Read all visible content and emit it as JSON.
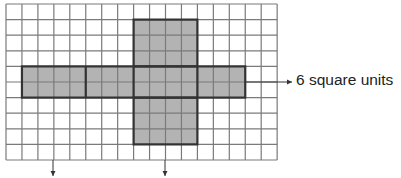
{
  "diagram": {
    "type": "net-on-grid",
    "grid": {
      "columns": 17,
      "rows": 10,
      "left": 6,
      "top": 4,
      "cell_w": 15.95,
      "cell_h": 15.6,
      "line_color": "#7a7a7a"
    },
    "fill_color": "#b3b3b3",
    "outline_color": "#333333",
    "shapes": [
      {
        "name": "vertical-bar",
        "col": 8,
        "row": 1,
        "cols": 4,
        "rows": 8
      },
      {
        "name": "horizontal-bar",
        "col": 1,
        "row": 4,
        "cols": 14,
        "rows": 2
      }
    ],
    "dividers": [
      {
        "orientation": "vertical",
        "col": 5,
        "row": 4,
        "rows": 2
      },
      {
        "orientation": "horizontal",
        "row": 4,
        "col": 8,
        "cols": 4
      },
      {
        "orientation": "horizontal",
        "row": 6,
        "col": 8,
        "cols": 4
      }
    ]
  },
  "annotations": {
    "right_label": "6 square units",
    "arrows": [
      {
        "name": "right-arrow",
        "from": [
          246,
          82
        ],
        "to": [
          292,
          82
        ]
      },
      {
        "name": "down-arrow-left",
        "from": [
          53,
          160
        ],
        "to": [
          53,
          176
        ]
      },
      {
        "name": "down-arrow-middle",
        "from": [
          165,
          160
        ],
        "to": [
          165,
          176
        ]
      }
    ]
  }
}
